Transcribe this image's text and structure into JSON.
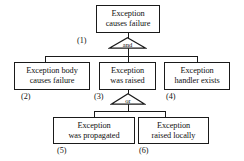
{
  "diagram": {
    "type": "fault-tree",
    "nodes": [
      {
        "id": "n1",
        "tag": "(1)",
        "lines": [
          "Exception",
          "causes failure"
        ],
        "text": "Exception causes failure",
        "level": "top"
      },
      {
        "id": "n2",
        "tag": "(2)",
        "lines": [
          "Exception body",
          "causes failure"
        ],
        "text": "Exception body causes failure",
        "level": "middle"
      },
      {
        "id": "n3",
        "tag": "(3)",
        "lines": [
          "Exception",
          "was raised"
        ],
        "text": "Exception was raised",
        "level": "middle"
      },
      {
        "id": "n4",
        "tag": "(4)",
        "lines": [
          "Exception",
          "handler exists"
        ],
        "text": "Exception handler exists",
        "level": "middle"
      },
      {
        "id": "n5",
        "tag": "(5)",
        "lines": [
          "Exception",
          "was propagated"
        ],
        "text": "Exception was propagated",
        "level": "bottom"
      },
      {
        "id": "n6",
        "tag": "(6)",
        "lines": [
          "Exception",
          "raised locally"
        ],
        "text": "Exception raised locally",
        "level": "bottom"
      }
    ],
    "gates": [
      {
        "id": "g1",
        "label": "and",
        "parent": "n1",
        "children": [
          "n2",
          "n3",
          "n4"
        ]
      },
      {
        "id": "g2",
        "label": "or",
        "parent": "n3",
        "children": [
          "n5",
          "n6"
        ]
      }
    ],
    "colors": {
      "stroke": "#1a1a1a",
      "text": "#111111",
      "background": "#ffffff"
    }
  }
}
